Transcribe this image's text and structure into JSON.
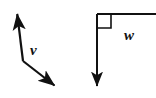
{
  "figure": {
    "background_color": "#ffffff",
    "stroke_color": "#111111",
    "left_diagram": {
      "name": "bent-double-arrow-vector-v",
      "label": "v",
      "label_position": {
        "x": 30,
        "y": 55
      },
      "description": "A two-segment bent line with arrowheads at both ends, labeled v",
      "vertex": {
        "x": 23,
        "y": 61
      },
      "upper_tip": {
        "x": 16,
        "y": 9
      },
      "lower_tip": {
        "x": 59,
        "y": 90
      },
      "stroke_width": 2.2,
      "arrowheads": [
        "upper_tip",
        "lower_tip"
      ]
    },
    "right_diagram": {
      "name": "perpendicular-vector-w",
      "label": "w",
      "label_position": {
        "x": 124,
        "y": 40
      },
      "description": "A downward arrow meeting a horizontal ray at a right angle, labeled w",
      "corner": {
        "x": 97,
        "y": 14
      },
      "vertical_tip": {
        "x": 97,
        "y": 91
      },
      "horizontal_end": {
        "x": 156,
        "y": 14
      },
      "right_angle_marker": {
        "x": 97,
        "y": 14,
        "size": 14
      },
      "stroke_width": 2.0,
      "arrowheads": [
        "vertical_tip"
      ]
    }
  }
}
